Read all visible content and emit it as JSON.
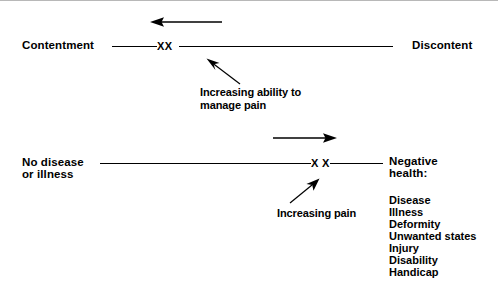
{
  "diagram": {
    "line_color": "#000000",
    "text_color": "#000000",
    "background": "#ffffff",
    "top_scale": {
      "left_label": "Contentment",
      "right_label": "Discontent",
      "markers": "XX",
      "direction_arrow": "left-arrow",
      "annotation_line1": "Increasing ability to",
      "annotation_line2": "manage pain",
      "annotation_arrow": "up-left-arrow"
    },
    "bottom_scale": {
      "left_label_line1": "No disease",
      "left_label_line2": "or illness",
      "right_label_line1": "Negative",
      "right_label_line2": "health:",
      "markers": "X X",
      "direction_arrow": "right-arrow",
      "annotation": "Increasing pain",
      "annotation_arrow": "up-right-arrow"
    },
    "negative_health_list": [
      "Disease",
      "Illness",
      "Deformity",
      "Unwanted states",
      "Injury",
      "Disability",
      "Handicap"
    ]
  }
}
